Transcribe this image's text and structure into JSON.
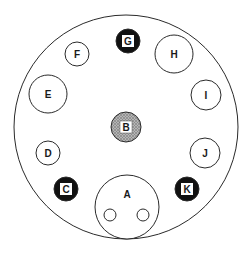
{
  "diagram": {
    "type": "circular-layout",
    "colors": {
      "stroke": "#2a2a2a",
      "outline_fill": "#ffffff",
      "dark_fill": "#111111",
      "gray_fill": "#9a9a9a",
      "label_box": "#ffffff",
      "text": "#1a1a1a"
    },
    "outer": {
      "cx": 126,
      "cy": 127,
      "r": 112
    },
    "nodes": [
      {
        "id": "A",
        "label": "A",
        "style": "outline",
        "cx": 127,
        "cy": 207,
        "r": 32,
        "label_y": 194,
        "sub_circles": [
          {
            "cx": 110,
            "cy": 215,
            "r": 6
          },
          {
            "cx": 143,
            "cy": 215,
            "r": 6
          }
        ]
      },
      {
        "id": "B",
        "label": "B",
        "style": "gray",
        "cx": 126,
        "cy": 127,
        "r": 15
      },
      {
        "id": "C",
        "label": "C",
        "style": "dark",
        "cx": 66,
        "cy": 189,
        "r": 12
      },
      {
        "id": "D",
        "label": "D",
        "style": "outline",
        "cx": 48,
        "cy": 153,
        "r": 12
      },
      {
        "id": "E",
        "label": "E",
        "style": "outline",
        "cx": 48,
        "cy": 94,
        "r": 19
      },
      {
        "id": "F",
        "label": "F",
        "style": "outline",
        "cx": 77,
        "cy": 54,
        "r": 12
      },
      {
        "id": "G",
        "label": "G",
        "style": "dark",
        "cx": 128,
        "cy": 41,
        "r": 12
      },
      {
        "id": "H",
        "label": "H",
        "style": "outline",
        "cx": 174,
        "cy": 54,
        "r": 19
      },
      {
        "id": "I",
        "label": "I",
        "style": "outline",
        "cx": 206,
        "cy": 95,
        "r": 15
      },
      {
        "id": "J",
        "label": "J",
        "style": "outline",
        "cx": 205,
        "cy": 153,
        "r": 15
      },
      {
        "id": "K",
        "label": "K",
        "style": "dark",
        "cx": 187,
        "cy": 189,
        "r": 12
      }
    ]
  }
}
